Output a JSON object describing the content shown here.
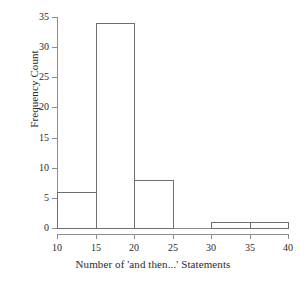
{
  "chart_data": {
    "type": "bar",
    "subtype": "histogram",
    "title": "",
    "xlabel": "Number of 'and then...' Statements",
    "ylabel": "Frequency Count",
    "categories": [
      "10-15",
      "15-20",
      "20-25",
      "25-30",
      "30-35",
      "35-40"
    ],
    "bin_edges": [
      10,
      15,
      20,
      25,
      30,
      35,
      40
    ],
    "values": [
      6,
      34,
      8,
      0,
      1,
      1
    ],
    "bins": [
      {
        "start": 10,
        "end": 15,
        "count": 6
      },
      {
        "start": 15,
        "end": 20,
        "count": 34
      },
      {
        "start": 20,
        "end": 25,
        "count": 8
      },
      {
        "start": 25,
        "end": 30,
        "count": 0
      },
      {
        "start": 30,
        "end": 35,
        "count": 1
      },
      {
        "start": 35,
        "end": 40,
        "count": 1
      }
    ],
    "xlim": [
      10,
      40
    ],
    "ylim": [
      0,
      35
    ],
    "xticks": [
      10,
      15,
      20,
      25,
      30,
      35,
      40
    ],
    "yticks": [
      0,
      5,
      10,
      15,
      20,
      25,
      30,
      35
    ],
    "grid": false,
    "legend": false,
    "bar_fill": "none",
    "bar_edge_color": "#6f6f6f",
    "axis_color": "#8d8d8d",
    "background": "#ffffff"
  }
}
